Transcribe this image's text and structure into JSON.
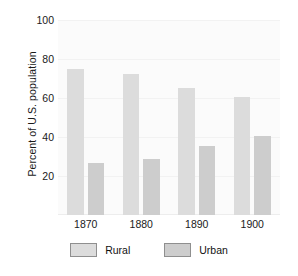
{
  "chart_data": {
    "type": "bar",
    "title": "",
    "xlabel": "",
    "ylabel": "Percent of U.S. population",
    "categories": [
      "1870",
      "1880",
      "1890",
      "1900"
    ],
    "series": [
      {
        "name": "Rural",
        "color": "#dcdcdc",
        "values": [
          75,
          72.5,
          65,
          60.5
        ]
      },
      {
        "name": "Urban",
        "color": "#cdcdcd",
        "values": [
          26.5,
          28.5,
          35.5,
          40.5
        ]
      }
    ],
    "ylim": [
      0,
      100
    ],
    "yticks": [
      20,
      40,
      60,
      80,
      100
    ],
    "ytick_labels": [
      "20",
      "40",
      "60",
      "80",
      "100"
    ],
    "grid": true,
    "legend_position": "bottom"
  },
  "legend": {
    "items": [
      {
        "label": "Rural",
        "swatch": "rural"
      },
      {
        "label": "Urban",
        "swatch": "urban"
      }
    ]
  }
}
